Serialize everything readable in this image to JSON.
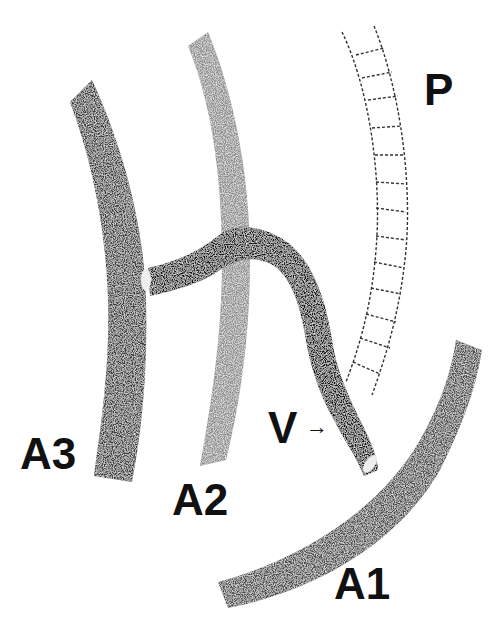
{
  "diagram": {
    "type": "vascular anastomosis schematic",
    "colors": {
      "background": "#ffffff",
      "dark_vessel": "#2a2a2a",
      "medium_vessel": "#555555",
      "light_vessel": "#9a9a9a",
      "vein_graft": "#111111",
      "outline": "#222222"
    },
    "labels": {
      "p": "P",
      "a3": "A3",
      "a2": "A2",
      "v": "V",
      "v_arrow": "→",
      "a1": "A1"
    },
    "structures": [
      {
        "id": "P",
        "description": "segmented tubular vessel (outlined, ringed)"
      },
      {
        "id": "A3",
        "description": "dark stippled vessel on left"
      },
      {
        "id": "A2",
        "description": "lighter stippled vessel in middle"
      },
      {
        "id": "A1",
        "description": "curved stippled vessel at bottom right"
      },
      {
        "id": "V",
        "description": "dark graft connecting A3 across A2 down to A1"
      }
    ]
  }
}
